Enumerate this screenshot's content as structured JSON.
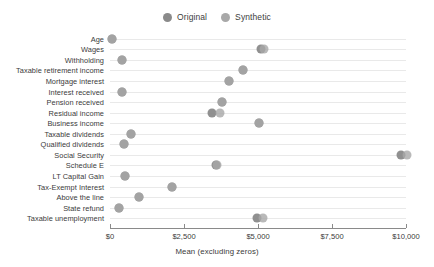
{
  "colors": {
    "original": "#8a8a8a",
    "synthetic": "#a8a8a8",
    "gridline": "#e9e9e9",
    "axis": "#8a8a8a",
    "text": "#3a3a3a"
  },
  "legend": {
    "entries": [
      {
        "label": "Original",
        "color": "#8a8a8a"
      },
      {
        "label": "Synthetic",
        "color": "#a8a8a8"
      }
    ]
  },
  "chart_data": {
    "type": "scatter",
    "title": "",
    "subtitle": "",
    "xlabel": "Mean (excluding zeros)",
    "ylabel": "",
    "xlim": [
      0,
      10000
    ],
    "xticks": [
      0,
      2500,
      5000,
      7500,
      10000
    ],
    "xticklabels": [
      "$0",
      "$2,500",
      "$5,000",
      "$7,500",
      "$10,000"
    ],
    "grid": true,
    "legend_position": "top-center",
    "orientation": "horizontal",
    "categories": [
      "Age",
      "Wages",
      "Withholding",
      "Taxable retirement income",
      "Mortgage interest",
      "Interest received",
      "Pension received",
      "Residual income",
      "Business income",
      "Taxable dividends",
      "Qualified dividends",
      "Social Security",
      "Schedule E",
      "LT Capital Gain",
      "Tax-Exempt Interest",
      "Above the line",
      "State refund",
      "Taxable unemployment"
    ],
    "series": [
      {
        "name": "Original",
        "color": "#8a8a8a",
        "values": [
          70,
          5100,
          410,
          4480,
          4030,
          390,
          3800,
          3450,
          5030,
          700,
          460,
          9830,
          3570,
          520,
          2110,
          990,
          310,
          4950
        ]
      },
      {
        "name": "Synthetic",
        "color": "#a8a8a8",
        "values": [
          70,
          5200,
          410,
          4480,
          4030,
          390,
          3800,
          3720,
          5030,
          700,
          460,
          10020,
          3620,
          520,
          2110,
          990,
          310,
          5180
        ]
      }
    ]
  }
}
